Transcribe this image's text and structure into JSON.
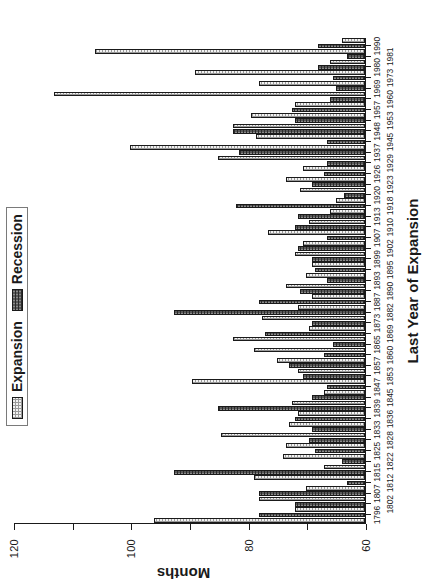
{
  "chart_data": {
    "type": "bar",
    "title": "",
    "subtitle": "",
    "xlabel": "Last Year of Expansion",
    "ylabel": "Months",
    "ylim": [
      0,
      120
    ],
    "yticks": [
      0,
      20,
      40,
      60,
      80,
      100,
      120
    ],
    "grid": false,
    "orientation": "vertical-bars-rotated-90ccw",
    "legend_position": "top-center",
    "legend": [
      {
        "name": "Expansion",
        "fill": "#f2f2f2",
        "pattern": "light-stipple"
      },
      {
        "name": "Recession",
        "fill": "#585858",
        "pattern": "dark-stipple"
      }
    ],
    "categories": [
      "1796",
      "1802",
      "1807",
      "1812",
      "1815",
      "1822",
      "1825",
      "1828",
      "1833",
      "1836",
      "1839",
      "1845",
      "1847",
      "1853",
      "1857",
      "1860",
      "1865",
      "1869",
      "1873",
      "1882",
      "1887",
      "1890",
      "1893",
      "1895",
      "1899",
      "1902",
      "1907",
      "1910",
      "1913",
      "1918",
      "1920",
      "1923",
      "1926",
      "1929",
      "1937",
      "1945",
      "1948",
      "1953",
      "1957",
      "1960",
      "1969",
      "1973",
      "1980",
      "1981",
      "1990"
    ],
    "tick_label_rows": [
      "1796",
      "1802",
      "1807",
      "1812",
      "1815",
      "1822",
      "1825",
      "1828",
      "1833",
      "1836",
      "1839",
      "1845",
      "1847",
      "1853",
      "1857",
      "1860",
      "1865",
      "1869",
      "1873",
      "1882",
      "1887",
      "1890",
      "1893",
      "1895",
      "1899",
      "1902",
      "1907",
      "1910",
      "1913",
      "1918",
      "1920",
      "1923",
      "1926",
      "1929",
      "1937",
      "1945",
      "1948",
      "1953",
      "1957",
      "1960",
      "1969",
      "1973",
      "1980",
      "1981",
      "1990"
    ],
    "bars": [
      {
        "category": "1796",
        "series": "Expansion",
        "value": 72
      },
      {
        "category": "1796",
        "series": "Recession",
        "value": 36
      },
      {
        "category": "1802",
        "series": "Expansion",
        "value": 24
      },
      {
        "category": "1802",
        "series": "Recession",
        "value": 24
      },
      {
        "category": "1807",
        "series": "Expansion",
        "value": 36
      },
      {
        "category": "1807",
        "series": "Recession",
        "value": 36
      },
      {
        "category": "1812",
        "series": "Expansion",
        "value": 20
      },
      {
        "category": "1812",
        "series": "Recession",
        "value": 6
      },
      {
        "category": "1815",
        "series": "Expansion",
        "value": 38
      },
      {
        "category": "1815",
        "series": "Recession",
        "value": 65
      },
      {
        "category": "1822",
        "series": "Expansion",
        "value": 14
      },
      {
        "category": "1822",
        "series": "Recession",
        "value": 8
      },
      {
        "category": "1825",
        "series": "Expansion",
        "value": 28
      },
      {
        "category": "1825",
        "series": "Recession",
        "value": 17
      },
      {
        "category": "1828",
        "series": "Expansion",
        "value": 27
      },
      {
        "category": "1828",
        "series": "Recession",
        "value": 19
      },
      {
        "category": "1833",
        "series": "Expansion",
        "value": 49
      },
      {
        "category": "1833",
        "series": "Recession",
        "value": 18
      },
      {
        "category": "1836",
        "series": "Expansion",
        "value": 26
      },
      {
        "category": "1836",
        "series": "Recession",
        "value": 24
      },
      {
        "category": "1839",
        "series": "Expansion",
        "value": 23
      },
      {
        "category": "1839",
        "series": "Recession",
        "value": 50
      },
      {
        "category": "1845",
        "series": "Expansion",
        "value": 25
      },
      {
        "category": "1845",
        "series": "Recession",
        "value": 18
      },
      {
        "category": "1847",
        "series": "Expansion",
        "value": 14
      },
      {
        "category": "1847",
        "series": "Recession",
        "value": 13
      },
      {
        "category": "1853",
        "series": "Expansion",
        "value": 59
      },
      {
        "category": "1853",
        "series": "Recession",
        "value": 21
      },
      {
        "category": "1857",
        "series": "Expansion",
        "value": 23
      },
      {
        "category": "1857",
        "series": "Recession",
        "value": 26
      },
      {
        "category": "1860",
        "series": "Expansion",
        "value": 30
      },
      {
        "category": "1860",
        "series": "Recession",
        "value": 14
      },
      {
        "category": "1865",
        "series": "Expansion",
        "value": 38
      },
      {
        "category": "1865",
        "series": "Recession",
        "value": 11
      },
      {
        "category": "1869",
        "series": "Expansion",
        "value": 45
      },
      {
        "category": "1869",
        "series": "Recession",
        "value": 34
      },
      {
        "category": "1873",
        "series": "Expansion",
        "value": 19
      },
      {
        "category": "1873",
        "series": "Recession",
        "value": 18
      },
      {
        "category": "1882",
        "series": "Expansion",
        "value": 35
      },
      {
        "category": "1882",
        "series": "Recession",
        "value": 65
      },
      {
        "category": "1887",
        "series": "Expansion",
        "value": 23
      },
      {
        "category": "1887",
        "series": "Recession",
        "value": 36
      },
      {
        "category": "1890",
        "series": "Expansion",
        "value": 18
      },
      {
        "category": "1890",
        "series": "Recession",
        "value": 22
      },
      {
        "category": "1893",
        "series": "Expansion",
        "value": 27
      },
      {
        "category": "1893",
        "series": "Recession",
        "value": 13
      },
      {
        "category": "1895",
        "series": "Expansion",
        "value": 20
      },
      {
        "category": "1895",
        "series": "Recession",
        "value": 17
      },
      {
        "category": "1899",
        "series": "Expansion",
        "value": 18
      },
      {
        "category": "1899",
        "series": "Recession",
        "value": 18
      },
      {
        "category": "1902",
        "series": "Expansion",
        "value": 24
      },
      {
        "category": "1902",
        "series": "Recession",
        "value": 23
      },
      {
        "category": "1907",
        "series": "Expansion",
        "value": 21
      },
      {
        "category": "1907",
        "series": "Recession",
        "value": 13
      },
      {
        "category": "1910",
        "series": "Expansion",
        "value": 33
      },
      {
        "category": "1910",
        "series": "Recession",
        "value": 24
      },
      {
        "category": "1913",
        "series": "Expansion",
        "value": 19
      },
      {
        "category": "1913",
        "series": "Recession",
        "value": 23
      },
      {
        "category": "1918",
        "series": "Expansion",
        "value": 12
      },
      {
        "category": "1918",
        "series": "Recession",
        "value": 44
      },
      {
        "category": "1920",
        "series": "Expansion",
        "value": 10
      },
      {
        "category": "1920",
        "series": "Recession",
        "value": 7
      },
      {
        "category": "1923",
        "series": "Expansion",
        "value": 22
      },
      {
        "category": "1923",
        "series": "Recession",
        "value": 18
      },
      {
        "category": "1926",
        "series": "Expansion",
        "value": 27
      },
      {
        "category": "1926",
        "series": "Recession",
        "value": 14
      },
      {
        "category": "1929",
        "series": "Expansion",
        "value": 21
      },
      {
        "category": "1929",
        "series": "Recession",
        "value": 13
      },
      {
        "category": "1937",
        "series": "Expansion",
        "value": 50
      },
      {
        "category": "1937",
        "series": "Recession",
        "value": 43
      },
      {
        "category": "1945",
        "series": "Expansion",
        "value": 80
      },
      {
        "category": "1945",
        "series": "Recession",
        "value": 13
      },
      {
        "category": "1948",
        "series": "Expansion",
        "value": 37
      },
      {
        "category": "1948",
        "series": "Recession",
        "value": 45
      },
      {
        "category": "1953",
        "series": "Expansion",
        "value": 45
      },
      {
        "category": "1953",
        "series": "Recession",
        "value": 24
      },
      {
        "category": "1957",
        "series": "Expansion",
        "value": 39
      },
      {
        "category": "1957",
        "series": "Recession",
        "value": 25
      },
      {
        "category": "1960",
        "series": "Expansion",
        "value": 24
      },
      {
        "category": "1960",
        "series": "Recession",
        "value": 12
      },
      {
        "category": "1969",
        "series": "Expansion",
        "value": 106
      },
      {
        "category": "1969",
        "series": "Recession",
        "value": 10
      },
      {
        "category": "1973",
        "series": "Expansion",
        "value": 36
      },
      {
        "category": "1973",
        "series": "Recession",
        "value": 11
      },
      {
        "category": "1980",
        "series": "Expansion",
        "value": 58
      },
      {
        "category": "1980",
        "series": "Recession",
        "value": 16
      },
      {
        "category": "1981",
        "series": "Expansion",
        "value": 12
      },
      {
        "category": "1981",
        "series": "Recession",
        "value": 6
      },
      {
        "category": "1990",
        "series": "Expansion",
        "value": 92
      },
      {
        "category": "1990",
        "series": "Recession",
        "value": 16
      },
      {
        "category": "1990",
        "series": "Expansion",
        "value": 8
      }
    ]
  },
  "axes": {
    "ylabel": "Months",
    "xlabel": "Last Year of Expansion",
    "ytick_labels": [
      "0",
      "20",
      "40",
      "60",
      "80",
      "100",
      "120"
    ],
    "xtick_labels": [
      "1796",
      "1802",
      "1807",
      "1812",
      "1815",
      "1822",
      "1825",
      "1828",
      "1833",
      "1836",
      "1839",
      "1845",
      "1847",
      "1853",
      "1857",
      "1860",
      "1865",
      "1869",
      "1873",
      "1882",
      "1887",
      "1890",
      "1893",
      "1895",
      "1899",
      "1902",
      "1907",
      "1910",
      "1913",
      "1918",
      "1920",
      "1923",
      "1926",
      "1929",
      "1937",
      "1945",
      "1948",
      "1953",
      "1957",
      "1960",
      "1969",
      "1973",
      "1980",
      "1981",
      "1990"
    ]
  },
  "legend": {
    "items": [
      {
        "label": "Expansion",
        "kind": "expansion"
      },
      {
        "label": "Recession",
        "kind": "recession"
      }
    ]
  },
  "colors": {
    "expansion_fill": "#f2f2f2",
    "recession_fill": "#585858",
    "axis": "#1a1a1a",
    "background": "#ffffff"
  }
}
